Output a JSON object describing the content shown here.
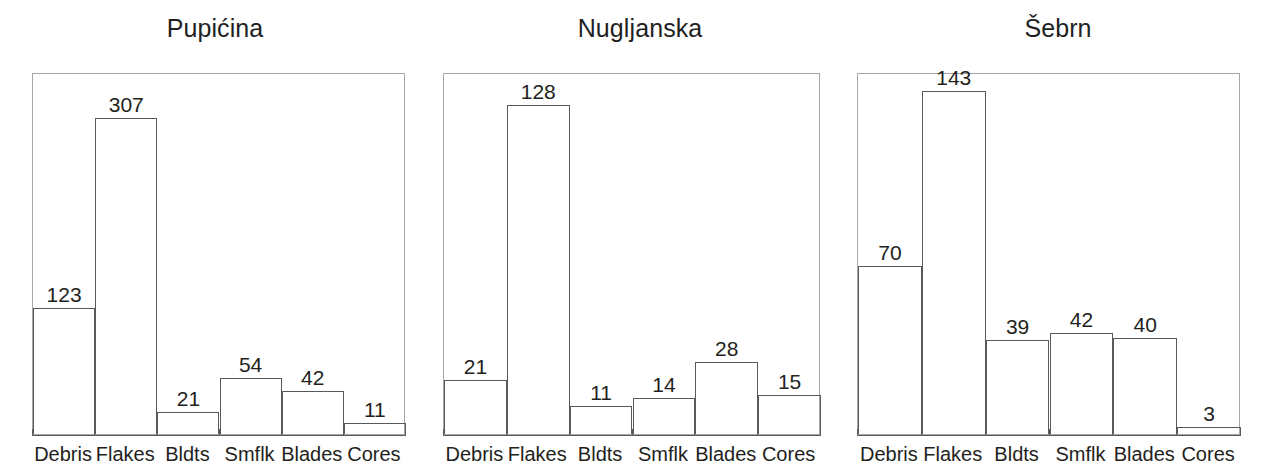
{
  "figure": {
    "background": "#ffffff",
    "line_color": "#58595b",
    "axis_color": "#595a5c",
    "frame_color": "#a6a6a6",
    "text_color": "#231f20"
  },
  "chart_data": [
    {
      "type": "bar",
      "title": "Pupićina",
      "categories": [
        "Debris",
        "Flakes",
        "Bldts",
        "Smflk",
        "Blades",
        "Cores"
      ],
      "values": [
        123,
        307,
        21,
        54,
        42,
        11
      ],
      "labels": [
        "123",
        "307",
        "21",
        "54",
        "42",
        "11"
      ],
      "xlabel": "",
      "ylabel": "",
      "ylim": [
        0,
        350
      ],
      "grid": false,
      "legend": "none",
      "panel": {
        "left": 0,
        "width": 430,
        "plot_left": 32,
        "plot_top": 73,
        "plot_width": 373,
        "plot_height": 362
      }
    },
    {
      "type": "bar",
      "title": "Nugljanska",
      "categories": [
        "Debris",
        "Flakes",
        "Bldts",
        "Smflk",
        "Blades",
        "Cores"
      ],
      "values": [
        21,
        128,
        11,
        14,
        28,
        15
      ],
      "labels": [
        "21",
        "128",
        "11",
        "14",
        "28",
        "15"
      ],
      "xlabel": "",
      "ylabel": "",
      "ylim": [
        0,
        140
      ],
      "grid": false,
      "legend": "none",
      "panel": {
        "left": 430,
        "width": 420,
        "plot_left": 13,
        "plot_top": 73,
        "plot_width": 377,
        "plot_height": 362
      }
    },
    {
      "type": "bar",
      "title": "Šebrn",
      "categories": [
        "Debris",
        "Flakes",
        "Bldts",
        "Smflk",
        "Blades",
        "Cores"
      ],
      "values": [
        70,
        143,
        39,
        42,
        40,
        3
      ],
      "labels": [
        "70",
        "143",
        "39",
        "42",
        "40",
        "3"
      ],
      "xlabel": "",
      "ylabel": "",
      "ylim": [
        0,
        150
      ],
      "grid": false,
      "legend": "none",
      "panel": {
        "left": 845,
        "width": 426,
        "plot_left": 12,
        "plot_top": 73,
        "plot_width": 383,
        "plot_height": 362
      }
    }
  ]
}
